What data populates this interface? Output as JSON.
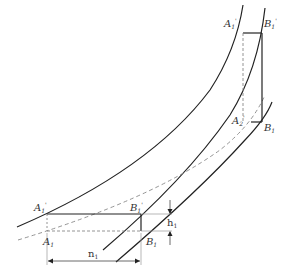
{
  "diagram": {
    "type": "geometric-construction",
    "colors": {
      "line": "#222222",
      "dashed": "#888888",
      "background": "#ffffff",
      "text": "#333333"
    },
    "labels": {
      "a1_prime_top": {
        "base": "A",
        "sub": "1",
        "sup": "'"
      },
      "b1_prime_top": {
        "base": "B",
        "sub": "1",
        "sup": "'"
      },
      "a2": {
        "base": "A",
        "sub": "2",
        "sup": "'"
      },
      "b1_top": {
        "base": "B",
        "sub": "1"
      },
      "a1_prime_bottom": {
        "base": "A",
        "sub": "1",
        "sup": "'"
      },
      "b1_prime_bottom": {
        "base": "B",
        "sub": "1",
        "sup": "'"
      },
      "a1_bottom": {
        "base": "A",
        "sub": "1"
      },
      "b1_bottom": {
        "base": "B",
        "sub": "1"
      },
      "h1": {
        "base": "h",
        "sub": "1"
      },
      "n1": {
        "base": "n",
        "sub": "1"
      }
    }
  }
}
